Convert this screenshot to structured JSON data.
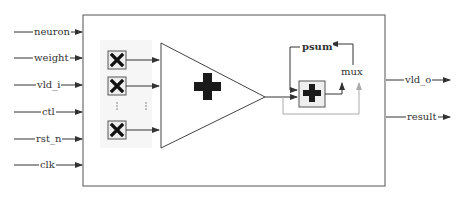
{
  "diagram": {
    "inputs": [
      {
        "label": "neuron",
        "y": 32
      },
      {
        "label": "weight",
        "y": 58
      },
      {
        "label": "vld_i",
        "y": 85
      },
      {
        "label": "ctl",
        "y": 112
      },
      {
        "label": "rst_n",
        "y": 139
      },
      {
        "label": "clk",
        "y": 165
      }
    ],
    "outputs": [
      {
        "label": "vld_o",
        "y": 80
      },
      {
        "label": "result",
        "y": 117
      }
    ],
    "multipliers": {
      "symbol": "×",
      "count_shown": 3,
      "ellipsis": "⋮"
    },
    "adder_tree": {
      "symbol": "+"
    },
    "accumulator": {
      "symbol": "+"
    },
    "labels": {
      "psum": "psum",
      "mux": "mux"
    },
    "colors": {
      "stroke": "#444444",
      "light_stroke": "#aaaaaa",
      "panel": "#f6f6f6",
      "symbol": "#1a1a1a"
    }
  }
}
